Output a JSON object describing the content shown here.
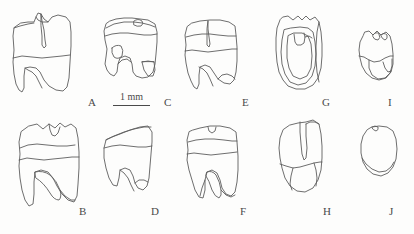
{
  "figure": {
    "type": "scientific-line-drawing-plate",
    "background_color": "#fdfdfc",
    "line_color": "#5d5d5d",
    "label_color": "#4a4a4a",
    "width": 414,
    "height": 234
  },
  "scale_bar": {
    "label": "1 mm",
    "x": 113,
    "y": 92,
    "bar_width": 37
  },
  "panels": [
    {
      "id": "A",
      "label": "A",
      "row": 1,
      "column": 1,
      "label_x": 88,
      "label_y": 97,
      "specimen_x": 8,
      "specimen_y": 10,
      "specimen_w": 72,
      "specimen_h": 85
    },
    {
      "id": "C",
      "label": "C",
      "row": 1,
      "column": 2,
      "label_x": 164,
      "label_y": 97,
      "specimen_x": 100,
      "specimen_y": 12,
      "specimen_w": 62,
      "specimen_h": 76
    },
    {
      "id": "E",
      "label": "E",
      "row": 1,
      "column": 3,
      "label_x": 242,
      "label_y": 97,
      "specimen_x": 182,
      "specimen_y": 17,
      "specimen_w": 57,
      "specimen_h": 78
    },
    {
      "id": "G",
      "label": "G",
      "row": 1,
      "column": 4,
      "label_x": 322,
      "label_y": 97,
      "specimen_x": 272,
      "specimen_y": 12,
      "specimen_w": 55,
      "specimen_h": 80
    },
    {
      "id": "I",
      "label": "I",
      "row": 1,
      "column": 5,
      "label_x": 388,
      "label_y": 97,
      "specimen_x": 355,
      "specimen_y": 26,
      "specimen_w": 42,
      "specimen_h": 56
    },
    {
      "id": "B",
      "label": "B",
      "row": 2,
      "column": 1,
      "label_x": 79,
      "label_y": 206,
      "specimen_x": 17,
      "specimen_y": 118,
      "specimen_w": 65,
      "specimen_h": 92
    },
    {
      "id": "D",
      "label": "D",
      "row": 2,
      "column": 2,
      "label_x": 151,
      "label_y": 206,
      "specimen_x": 100,
      "specimen_y": 120,
      "specimen_w": 56,
      "specimen_h": 74
    },
    {
      "id": "F",
      "label": "F",
      "row": 2,
      "column": 3,
      "label_x": 240,
      "label_y": 206,
      "specimen_x": 184,
      "specimen_y": 120,
      "specimen_w": 56,
      "specimen_h": 83
    },
    {
      "id": "H",
      "label": "H",
      "row": 2,
      "column": 4,
      "label_x": 323,
      "label_y": 206,
      "specimen_x": 276,
      "specimen_y": 116,
      "specimen_w": 52,
      "specimen_h": 80
    },
    {
      "id": "J",
      "label": "J",
      "row": 2,
      "column": 5,
      "label_x": 389,
      "label_y": 206,
      "specimen_x": 358,
      "specimen_y": 122,
      "specimen_w": 42,
      "specimen_h": 57
    }
  ]
}
